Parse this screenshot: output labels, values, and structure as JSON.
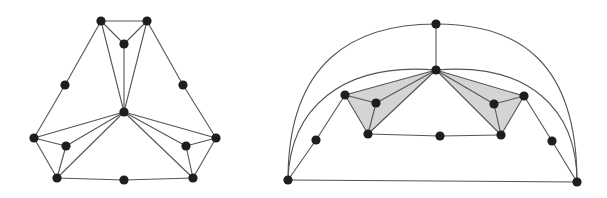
{
  "style": {
    "background": "#ffffff",
    "edge_color": "#555555",
    "node_color": "#1e1e1e",
    "face_fill": "#d4d4d4",
    "node_radius": 4.6,
    "edge_width": 1.1
  },
  "graphs": [
    {
      "name": "left-graph",
      "nodes": {
        "tl": [
          101,
          21
        ],
        "tr": [
          147,
          21
        ],
        "ti": [
          124,
          44
        ],
        "ml": [
          65,
          85
        ],
        "mr": [
          183,
          85
        ],
        "c": [
          124,
          112
        ],
        "l": [
          34,
          138
        ],
        "r": [
          216,
          138
        ],
        "il": [
          66,
          146
        ],
        "ir": [
          186,
          146
        ],
        "bl": [
          57,
          178
        ],
        "bm": [
          124,
          180
        ],
        "br": [
          193,
          178
        ]
      },
      "edges": [
        [
          "tl",
          "tr"
        ],
        [
          "tl",
          "ti"
        ],
        [
          "tr",
          "ti"
        ],
        [
          "ti",
          "c"
        ],
        [
          "tl",
          "c"
        ],
        [
          "tr",
          "c"
        ],
        [
          "tl",
          "ml"
        ],
        [
          "ml",
          "l"
        ],
        [
          "tr",
          "mr"
        ],
        [
          "mr",
          "r"
        ],
        [
          "l",
          "c"
        ],
        [
          "il",
          "c"
        ],
        [
          "bl",
          "c"
        ],
        [
          "l",
          "il"
        ],
        [
          "l",
          "bl"
        ],
        [
          "il",
          "bl"
        ],
        [
          "r",
          "c"
        ],
        [
          "ir",
          "c"
        ],
        [
          "br",
          "c"
        ],
        [
          "r",
          "ir"
        ],
        [
          "r",
          "br"
        ],
        [
          "ir",
          "br"
        ],
        [
          "bl",
          "bm"
        ],
        [
          "bm",
          "br"
        ]
      ],
      "faces": [],
      "arcs": []
    },
    {
      "name": "right-graph",
      "nodes": {
        "t": [
          436,
          24
        ],
        "h": [
          436,
          70
        ],
        "L": [
          345,
          95
        ],
        "Li": [
          376,
          103
        ],
        "LB": [
          368,
          134
        ],
        "R": [
          524,
          96
        ],
        "Ri": [
          494,
          104
        ],
        "RB": [
          501,
          135
        ],
        "bm": [
          440,
          136
        ],
        "LM": [
          316,
          140
        ],
        "RM": [
          552,
          141
        ],
        "BL": [
          288,
          180
        ],
        "BR": [
          577,
          182
        ]
      },
      "edges": [
        [
          "t",
          "h"
        ],
        [
          "h",
          "L"
        ],
        [
          "h",
          "Li"
        ],
        [
          "h",
          "LB"
        ],
        [
          "L",
          "Li"
        ],
        [
          "Li",
          "LB"
        ],
        [
          "L",
          "LB"
        ],
        [
          "h",
          "R"
        ],
        [
          "h",
          "Ri"
        ],
        [
          "h",
          "RB"
        ],
        [
          "R",
          "Ri"
        ],
        [
          "Ri",
          "RB"
        ],
        [
          "R",
          "RB"
        ],
        [
          "LB",
          "bm"
        ],
        [
          "bm",
          "RB"
        ],
        [
          "L",
          "LM"
        ],
        [
          "LM",
          "BL"
        ],
        [
          "R",
          "RM"
        ],
        [
          "RM",
          "BR"
        ],
        [
          "BL",
          "BR"
        ]
      ],
      "faces": [
        [
          "h",
          "L",
          "LB"
        ],
        [
          "h",
          "R",
          "RB"
        ]
      ],
      "arcs": [
        "M 288 180 C 288 60, 355 24, 436 24 C 517 24, 577 60, 577 182",
        "M 288 180 C 290 110, 340 62, 436 70",
        "M 436 70 C 530 62, 577 110, 577 182"
      ]
    }
  ]
}
